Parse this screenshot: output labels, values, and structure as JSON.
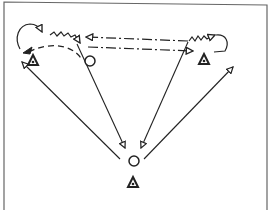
{
  "diagram": {
    "type": "sports-drill",
    "frame": {
      "stroke": "#555555"
    },
    "ink": "#222222",
    "players": [
      {
        "id": "triangle-left",
        "shape": "triangle",
        "x": 33,
        "y": 61
      },
      {
        "id": "triangle-right",
        "shape": "triangle",
        "x": 204,
        "y": 60
      },
      {
        "id": "triangle-bottom",
        "shape": "triangle",
        "x": 133,
        "y": 183
      }
    ],
    "markers": [
      {
        "id": "circle-left",
        "shape": "circle",
        "x": 90,
        "y": 61,
        "r": 5
      },
      {
        "id": "circle-bottom",
        "shape": "circle",
        "x": 134,
        "y": 161,
        "r": 5
      }
    ],
    "paths": {
      "pass_left_to_right": "dash-dot",
      "pass_right_to_left": "dash-dot",
      "dribble_left": "zigzag",
      "dribble_right": "zigzag",
      "run_left_curve": "dashed",
      "long_passes": "solid"
    }
  }
}
